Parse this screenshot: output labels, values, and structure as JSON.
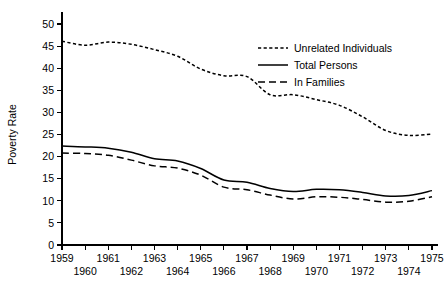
{
  "chart_data": {
    "type": "line",
    "title": "",
    "xlabel": "",
    "ylabel": "Poverty Rate",
    "xlim": [
      1959,
      1975
    ],
    "ylim": [
      0,
      50
    ],
    "yticks": [
      0,
      5,
      10,
      15,
      20,
      25,
      30,
      35,
      40,
      45,
      50
    ],
    "xticks": [
      1959,
      1960,
      1961,
      1962,
      1963,
      1964,
      1965,
      1966,
      1967,
      1968,
      1969,
      1970,
      1971,
      1972,
      1973,
      1974,
      1975
    ],
    "grid": false,
    "legend_position": "upper right",
    "x": [
      1959,
      1960,
      1961,
      1962,
      1963,
      1964,
      1965,
      1966,
      1967,
      1968,
      1969,
      1970,
      1971,
      1972,
      1973,
      1974,
      1975
    ],
    "series": [
      {
        "name": "Unrelated Individuals",
        "style": "dotted",
        "values": [
          46.1,
          45.2,
          45.9,
          45.4,
          44.2,
          42.7,
          39.8,
          38.3,
          38.1,
          34.0,
          34.0,
          32.9,
          31.6,
          29.0,
          25.9,
          24.8,
          25.1
        ]
      },
      {
        "name": "Total Persons",
        "style": "solid",
        "values": [
          22.4,
          22.2,
          21.9,
          21.0,
          19.5,
          19.0,
          17.3,
          14.7,
          14.2,
          12.8,
          12.1,
          12.6,
          12.5,
          11.9,
          11.1,
          11.2,
          12.3
        ]
      },
      {
        "name": "In Families",
        "style": "dashed",
        "values": [
          20.8,
          20.7,
          20.3,
          19.2,
          17.9,
          17.4,
          15.8,
          13.1,
          12.5,
          11.3,
          10.4,
          10.9,
          10.8,
          10.3,
          9.7,
          9.9,
          10.9
        ]
      }
    ],
    "legend": [
      {
        "label": "Unrelated Individuals",
        "style": "dotted"
      },
      {
        "label": "Total Persons",
        "style": "solid"
      },
      {
        "label": "In Families",
        "style": "dashed"
      }
    ],
    "ytick_labels": [
      "0",
      "5",
      "10",
      "15",
      "20",
      "25",
      "30",
      "35",
      "40",
      "45",
      "50"
    ],
    "xtick_labels_top": [
      "1959",
      "1961",
      "1963",
      "1965",
      "1967",
      "1969",
      "1971",
      "1973",
      "1975"
    ],
    "xtick_labels_bottom": [
      "1960",
      "1962",
      "1964",
      "1966",
      "1968",
      "1970",
      "1972",
      "1974"
    ],
    "colors": {
      "line": "#000000",
      "background": "#ffffff",
      "text": "#000000"
    }
  }
}
